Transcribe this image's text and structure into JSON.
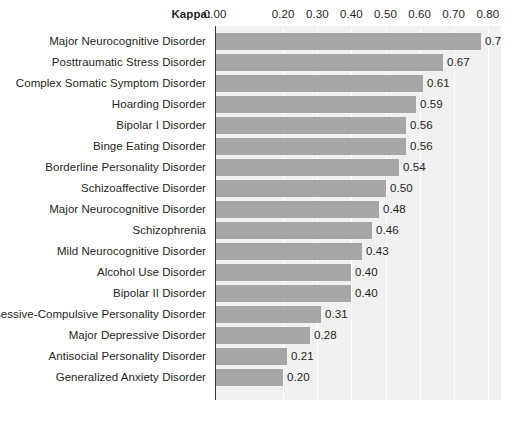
{
  "axis": {
    "kappa_label": "Kappa:",
    "tick_labels": [
      "0.00",
      "0.20",
      "0.30",
      "0.40",
      "0.50",
      "0.60",
      "0.70",
      "0.80"
    ],
    "tick_values": [
      0.0,
      0.2,
      0.3,
      0.4,
      0.5,
      0.6,
      0.7,
      0.8
    ]
  },
  "colors": {
    "bar_fill": "#a6a6a6",
    "plot_background": "#f1f1f1",
    "gridline": "#ffffff",
    "zero_axis": "#3b3b3b",
    "text": "#231f20",
    "page_background": "#ffffff"
  },
  "chart_data": {
    "type": "bar",
    "orientation": "horizontal",
    "title": "",
    "subtitle": "",
    "xlabel": "Kappa:",
    "ylabel": "",
    "xlim": [
      0.0,
      0.84
    ],
    "grid": true,
    "gridlines_x": [
      0.2,
      0.3,
      0.4,
      0.5,
      0.6,
      0.7,
      0.8
    ],
    "legend": "none",
    "data_labels": true,
    "categories": [
      "Major Neurocognitive Disorder",
      "Posttraumatic Stress Disorder",
      "Complex Somatic Symptom Disorder",
      "Hoarding Disorder",
      "Bipolar I Disorder",
      "Binge Eating Disorder",
      "Borderline Personality Disorder",
      "Schizoaffective Disorder",
      "Major Neurocognitive Disorder",
      "Schizophrenia",
      "Mild Neurocognitive Disorder",
      "Alcohol Use Disorder",
      "Bipolar II Disorder",
      "Obsessive-Compulsive Personality Disorder",
      "Major Depressive Disorder",
      "Antisocial Personality Disorder",
      "Generalized Anxiety Disorder"
    ],
    "values": [
      0.78,
      0.67,
      0.61,
      0.59,
      0.56,
      0.56,
      0.54,
      0.5,
      0.48,
      0.46,
      0.43,
      0.4,
      0.4,
      0.31,
      0.28,
      0.21,
      0.2
    ],
    "value_labels": [
      "0.78",
      "0.67",
      "0.61",
      "0.59",
      "0.56",
      "0.56",
      "0.54",
      "0.50",
      "0.48",
      "0.46",
      "0.43",
      "0.40",
      "0.40",
      "0.31",
      "0.28",
      "0.21",
      "0.20"
    ]
  }
}
